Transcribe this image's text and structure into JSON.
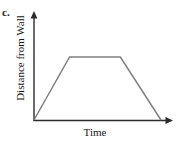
{
  "figure": {
    "part_label": "c.",
    "axis_color": "#2b2b2b",
    "curve_color": "#808080",
    "background_color": "#ffffff"
  },
  "chart_data": {
    "type": "line",
    "title": "",
    "subtitle": "",
    "xlabel": "Time",
    "ylabel": "Distance from Wall",
    "grid": false,
    "legend": null,
    "axis_ticks": {
      "x": [],
      "y": []
    },
    "xlim": [
      0,
      1
    ],
    "ylim": [
      0,
      1
    ],
    "annotations": [
      "c."
    ],
    "series": [
      {
        "name": "Distance from Wall vs Time",
        "description": "Trapezoid: increases linearly from zero, holds constant, then decreases linearly back to zero",
        "x": [
          0,
          0.28,
          0.68,
          1.0
        ],
        "y": [
          0,
          0.72,
          0.72,
          0
        ]
      }
    ]
  }
}
